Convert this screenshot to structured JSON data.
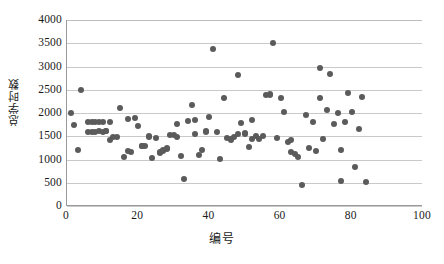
{
  "chart_data": {
    "type": "scatter",
    "title": "",
    "xlabel": "编号",
    "ylabel": "总学时数",
    "xlim": [
      0,
      100
    ],
    "ylim": [
      0,
      4000
    ],
    "xticks": [
      0,
      20,
      40,
      60,
      80,
      100
    ],
    "yticks": [
      0,
      500,
      1000,
      1500,
      2000,
      2500,
      3000,
      3500,
      4000
    ],
    "grid": "horizontal",
    "legend": "none",
    "marker": {
      "shape": "circle",
      "color": "#5b5b5b",
      "size_px": 6
    },
    "series": [
      {
        "name": "总学时数",
        "points": [
          [
            1,
            2000
          ],
          [
            2,
            1750
          ],
          [
            3,
            1215
          ],
          [
            4,
            2490
          ],
          [
            6,
            1810
          ],
          [
            6,
            1590
          ],
          [
            7,
            1600
          ],
          [
            7,
            1810
          ],
          [
            8,
            1600
          ],
          [
            8,
            1810
          ],
          [
            9,
            1610
          ],
          [
            9,
            1810
          ],
          [
            10,
            1600
          ],
          [
            10,
            1810
          ],
          [
            11,
            1620
          ],
          [
            11,
            1615
          ],
          [
            12,
            1425
          ],
          [
            12,
            1805
          ],
          [
            13,
            1490
          ],
          [
            14,
            1480
          ],
          [
            15,
            2105
          ],
          [
            16,
            1055
          ],
          [
            17,
            1870
          ],
          [
            17,
            1185
          ],
          [
            18,
            1170
          ],
          [
            19,
            1890
          ],
          [
            20,
            1715
          ],
          [
            21,
            1300
          ],
          [
            21,
            1285
          ],
          [
            22,
            1300
          ],
          [
            23,
            1495
          ],
          [
            23,
            1490
          ],
          [
            24,
            1035
          ],
          [
            25,
            1465
          ],
          [
            26,
            1140
          ],
          [
            26,
            1165
          ],
          [
            27,
            1190
          ],
          [
            27,
            1210
          ],
          [
            28,
            1225
          ],
          [
            28,
            1245
          ],
          [
            29,
            1525
          ],
          [
            30,
            1530
          ],
          [
            31,
            1760
          ],
          [
            31,
            1480
          ],
          [
            32,
            1065
          ],
          [
            33,
            575
          ],
          [
            34,
            1835
          ],
          [
            35,
            2180
          ],
          [
            36,
            1540
          ],
          [
            36,
            1845
          ],
          [
            37,
            1100
          ],
          [
            38,
            1215
          ],
          [
            39,
            1605
          ],
          [
            39,
            1585
          ],
          [
            40,
            1910
          ],
          [
            41,
            3380
          ],
          [
            42,
            1600
          ],
          [
            43,
            1020
          ],
          [
            44,
            2330
          ],
          [
            45,
            1470
          ],
          [
            46,
            1420
          ],
          [
            46,
            1440
          ],
          [
            47,
            1490
          ],
          [
            48,
            2815
          ],
          [
            48,
            1555
          ],
          [
            49,
            1790
          ],
          [
            50,
            1570
          ],
          [
            50,
            1545
          ],
          [
            51,
            1265
          ],
          [
            52,
            1440
          ],
          [
            52,
            1845
          ],
          [
            53,
            1500
          ],
          [
            54,
            1450
          ],
          [
            55,
            1505
          ],
          [
            56,
            2395
          ],
          [
            57,
            2410
          ],
          [
            57,
            2390
          ],
          [
            58,
            3500
          ],
          [
            59,
            1455
          ],
          [
            60,
            2330
          ],
          [
            61,
            2020
          ],
          [
            62,
            1385
          ],
          [
            63,
            1410
          ],
          [
            63,
            1155
          ],
          [
            64,
            1115
          ],
          [
            65,
            1045
          ],
          [
            66,
            450
          ],
          [
            67,
            1950
          ],
          [
            68,
            1240
          ],
          [
            69,
            1815
          ],
          [
            70,
            1185
          ],
          [
            71,
            2975
          ],
          [
            71,
            2320
          ],
          [
            72,
            1450
          ],
          [
            73,
            2055
          ],
          [
            74,
            2840
          ],
          [
            75,
            1765
          ],
          [
            76,
            1990
          ],
          [
            77,
            1205
          ],
          [
            77,
            540
          ],
          [
            78,
            1800
          ],
          [
            79,
            2425
          ],
          [
            80,
            2030
          ],
          [
            81,
            830
          ],
          [
            82,
            1665
          ],
          [
            83,
            2350
          ],
          [
            84,
            520
          ]
        ]
      }
    ]
  },
  "axes": {
    "y_tick_labels": [
      "4000",
      "3500",
      "3000",
      "2500",
      "2000",
      "1500",
      "1000",
      "500",
      "0"
    ],
    "x_tick_labels": [
      "0",
      "20",
      "40",
      "60",
      "80",
      "100"
    ],
    "y_title": "总学时数",
    "x_title": "编号"
  }
}
